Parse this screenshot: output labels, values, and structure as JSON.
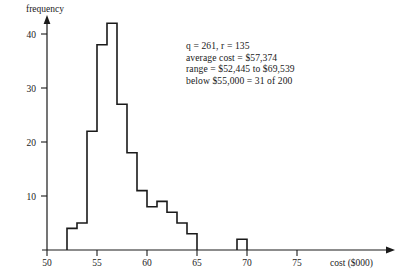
{
  "chart_data": {
    "type": "bar",
    "title": "",
    "xlabel": "cost ($000)",
    "ylabel": "frequency",
    "xlim": [
      50,
      78
    ],
    "ylim": [
      0,
      44
    ],
    "grid": false,
    "legend": null,
    "bin_width": 1,
    "categories": [
      "52-53",
      "53-54",
      "54-55",
      "55-56",
      "56-57",
      "57-58",
      "58-59",
      "59-60",
      "60-61",
      "61-62",
      "62-63",
      "63-64",
      "64-65",
      "65-66",
      "69-70"
    ],
    "bin_starts": [
      52,
      53,
      54,
      55,
      56,
      57,
      58,
      59,
      60,
      61,
      62,
      63,
      64,
      65,
      69
    ],
    "values": [
      4,
      5,
      22,
      38,
      42,
      27,
      18,
      11,
      8,
      9,
      7,
      5,
      3,
      0,
      2
    ],
    "x_ticks": [
      50,
      55,
      60,
      65,
      70,
      75
    ],
    "y_ticks": [
      10,
      20,
      30,
      40
    ]
  },
  "axes": {
    "y_title": "frequency",
    "x_title": "cost ($000)",
    "x_tick_labels": [
      "50",
      "55",
      "60",
      "65",
      "70",
      "75"
    ],
    "y_tick_labels": [
      "10",
      "20",
      "30",
      "40"
    ]
  },
  "annotation": {
    "line1_q_symbol": "q",
    "line1": "q = 261, r = 135",
    "line2": "average cost = $57,374",
    "line3": "range = $52,445 to $69,539",
    "line4": "below $55,000 = 31 of 200"
  },
  "colors": {
    "axis": "#1a1a1a",
    "bars": "#1a1a1a",
    "background": "#ffffff"
  }
}
